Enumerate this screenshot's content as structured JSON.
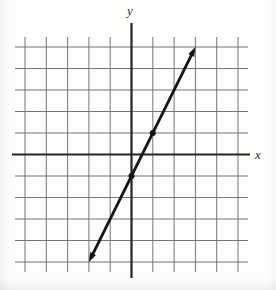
{
  "page": {
    "background": "#fdfdfb"
  },
  "figure": {
    "grid_color": "#757575",
    "axis_color": "#242424",
    "line_color": "#151515",
    "point_color": "#151515"
  },
  "chart_data": {
    "type": "line",
    "title": "",
    "xlabel": "x",
    "ylabel": "y",
    "xlim": [
      -5,
      5
    ],
    "ylim": [
      -5,
      5
    ],
    "grid": true,
    "grid_step": 1,
    "axes_through_origin": true,
    "series": [
      {
        "name": "plotted-line",
        "equation": "y = 2x - 1",
        "slope": 2,
        "y_intercept": -1,
        "segment_from": [
          -2,
          -5
        ],
        "segment_to": [
          3,
          5
        ],
        "arrow_both_ends": true,
        "marked_points": [
          [
            0,
            -1
          ],
          [
            1,
            1
          ]
        ]
      }
    ]
  }
}
